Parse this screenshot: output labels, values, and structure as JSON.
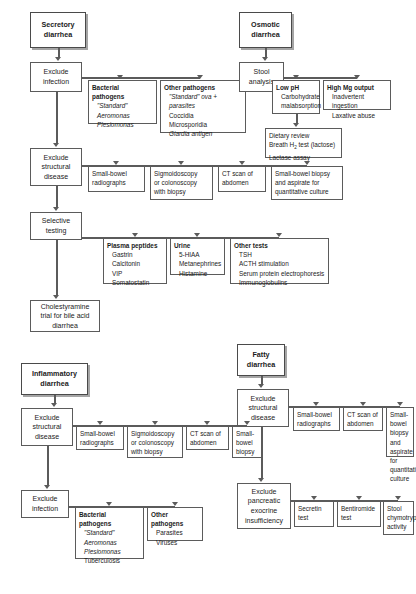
{
  "diagram": {
    "type": "clinical-algorithm-flowchart",
    "caption": "",
    "branches": [
      {
        "id": "secretory",
        "header": [
          "Secretory",
          "diarrhea"
        ],
        "steps": [
          {
            "id": "sec-exclude-infection",
            "lines": [
              "Exclude",
              "infection"
            ]
          },
          {
            "id": "sec-exclude-structural",
            "lines": [
              "Exclude",
              "structural",
              "disease"
            ]
          },
          {
            "id": "sec-selective-testing",
            "lines": [
              "Selective",
              "testing"
            ]
          },
          {
            "id": "sec-cholestyramine",
            "lines": [
              "Cholestyramine",
              "trial for bile acid",
              "diarrhea"
            ]
          }
        ],
        "panels": [
          {
            "id": "sec-bacterial-pathogens",
            "title": "Bacterial pathogens",
            "items": [
              {
                "text": "\"Standard\"",
                "style": "italic"
              },
              {
                "text": "Aeromonas",
                "style": "italic"
              },
              {
                "text": "Plesiomonas",
                "style": "italic"
              }
            ]
          },
          {
            "id": "sec-other-pathogens",
            "title": "Other pathogens",
            "items": [
              {
                "text": "\"Standard\" ova + parasites",
                "style": "italic"
              },
              {
                "text": "Coccidia",
                "style": "normal"
              },
              {
                "text": "Microsporidia",
                "style": "normal"
              },
              {
                "text": "Giardia antigen",
                "style": "italic"
              }
            ]
          },
          {
            "id": "sec-small-bowel-radiographs",
            "title": "",
            "items": [
              {
                "text": "Small-bowel",
                "style": "normal"
              },
              {
                "text": "radiographs",
                "style": "normal"
              }
            ]
          },
          {
            "id": "sec-sigmoidoscopy",
            "title": "",
            "items": [
              {
                "text": "Sigmoidoscopy",
                "style": "normal"
              },
              {
                "text": "or colonoscopy",
                "style": "normal"
              },
              {
                "text": "with biopsy",
                "style": "normal"
              }
            ]
          },
          {
            "id": "sec-ct-abdomen",
            "title": "",
            "items": [
              {
                "text": "CT scan of",
                "style": "normal"
              },
              {
                "text": "abdomen",
                "style": "normal"
              }
            ]
          },
          {
            "id": "sec-small-bowel-biopsy",
            "title": "",
            "items": [
              {
                "text": "Small-bowel biopsy",
                "style": "normal"
              },
              {
                "text": "and  aspirate for",
                "style": "normal"
              },
              {
                "text": "quantitative culture",
                "style": "normal"
              }
            ]
          },
          {
            "id": "sec-plasma-peptides",
            "title": "Plasma peptides",
            "items": [
              {
                "text": "Gastrin",
                "style": "normal"
              },
              {
                "text": "Calcitonin",
                "style": "normal"
              },
              {
                "text": "VIP",
                "style": "normal"
              },
              {
                "text": "Somatostatin",
                "style": "normal"
              }
            ]
          },
          {
            "id": "sec-urine",
            "title": "Urine",
            "items": [
              {
                "text": "5-HIAA",
                "style": "normal"
              },
              {
                "text": "Metanephrines",
                "style": "normal"
              },
              {
                "text": "Histamine",
                "style": "normal"
              }
            ]
          },
          {
            "id": "sec-other-tests",
            "title": "Other tests",
            "items": [
              {
                "text": "TSH",
                "style": "normal"
              },
              {
                "text": "ACTH stimulation",
                "style": "normal"
              },
              {
                "text": "Serum protein electrophoresis",
                "style": "normal"
              },
              {
                "text": "Immunoglobulins",
                "style": "normal"
              }
            ]
          }
        ]
      },
      {
        "id": "osmotic",
        "header": [
          "Osmotic",
          "diarrhea"
        ],
        "steps": [
          {
            "id": "osm-stool-analysis",
            "lines": [
              "Stool",
              "analysis"
            ]
          }
        ],
        "panels": [
          {
            "id": "osm-low-ph",
            "title": "Low pH",
            "items": [
              {
                "text": "Carbohydrate",
                "style": "normal"
              },
              {
                "text": "malabsorption",
                "style": "normal",
                "indent": true
              }
            ]
          },
          {
            "id": "osm-high-mg",
            "title": "High Mg output",
            "items": [
              {
                "text": "Inadvertent ingestion",
                "style": "normal"
              },
              {
                "text": "Laxative abuse",
                "style": "normal"
              }
            ]
          },
          {
            "id": "osm-dietary-review",
            "title": "",
            "items": [
              {
                "text": "Dietary review",
                "style": "normal"
              },
              {
                "text": "Breath H2 test (lactose)",
                "style": "normal",
                "subscript": "H2"
              },
              {
                "text": "Lactase assay",
                "style": "normal"
              }
            ]
          }
        ]
      },
      {
        "id": "inflammatory",
        "header": [
          "Inflammatory",
          "diarrhea"
        ],
        "steps": [
          {
            "id": "inf-exclude-structural",
            "lines": [
              "Exclude",
              "structural",
              "disease"
            ]
          },
          {
            "id": "inf-exclude-infection",
            "lines": [
              "Exclude",
              "infection"
            ]
          }
        ],
        "panels": [
          {
            "id": "inf-small-bowel-radiographs",
            "title": "",
            "items": [
              {
                "text": "Small-bowel",
                "style": "normal"
              },
              {
                "text": "radiographs",
                "style": "normal"
              }
            ]
          },
          {
            "id": "inf-sigmoidoscopy",
            "title": "",
            "items": [
              {
                "text": "Sigmoidoscopy",
                "style": "normal"
              },
              {
                "text": "or colonoscopy",
                "style": "normal"
              },
              {
                "text": "with biopsy",
                "style": "normal"
              }
            ]
          },
          {
            "id": "inf-ct-abdomen",
            "title": "",
            "items": [
              {
                "text": "CT scan of",
                "style": "normal"
              },
              {
                "text": "abdomen",
                "style": "normal"
              }
            ]
          },
          {
            "id": "inf-small-bowel-biopsy",
            "title": "",
            "items": [
              {
                "text": "Small-",
                "style": "normal"
              },
              {
                "text": "bowel",
                "style": "normal"
              },
              {
                "text": "biopsy",
                "style": "normal"
              }
            ]
          },
          {
            "id": "inf-bacterial-pathogens",
            "title": "Bacterial pathogens",
            "items": [
              {
                "text": "\"Standard\"",
                "style": "italic"
              },
              {
                "text": "Aeromonas",
                "style": "italic"
              },
              {
                "text": "Plesiomonas",
                "style": "italic"
              },
              {
                "text": "Tuberculosis",
                "style": "normal"
              }
            ]
          },
          {
            "id": "inf-other-pathogens",
            "title": "Other pathogens",
            "items": [
              {
                "text": "Parasites",
                "style": "normal"
              },
              {
                "text": "Viruses",
                "style": "normal"
              }
            ]
          }
        ]
      },
      {
        "id": "fatty",
        "header": [
          "Fatty",
          "diarrhea"
        ],
        "steps": [
          {
            "id": "fat-exclude-structural",
            "lines": [
              "Exclude",
              "structural",
              "disease"
            ]
          },
          {
            "id": "fat-exclude-pancreatic",
            "lines": [
              "Exclude",
              "pancreatic",
              "exocrine",
              "insufficiency"
            ]
          }
        ],
        "panels": [
          {
            "id": "fat-small-bowel-radiographs",
            "title": "",
            "items": [
              {
                "text": "Small-bowel",
                "style": "normal"
              },
              {
                "text": "radiographs",
                "style": "normal"
              }
            ]
          },
          {
            "id": "fat-ct-abdomen",
            "title": "",
            "items": [
              {
                "text": "CT scan of",
                "style": "normal"
              },
              {
                "text": "abdomen",
                "style": "normal"
              }
            ]
          },
          {
            "id": "fat-small-bowel-biopsy",
            "title": "",
            "items": [
              {
                "text": "Small-bowel",
                "style": "normal"
              },
              {
                "text": "biopsy and",
                "style": "normal"
              },
              {
                "text": "aspirate for",
                "style": "normal"
              },
              {
                "text": "quantitative",
                "style": "normal"
              },
              {
                "text": "culture",
                "style": "normal"
              }
            ]
          },
          {
            "id": "fat-secretin-test",
            "title": "",
            "items": [
              {
                "text": "Secretin",
                "style": "normal"
              },
              {
                "text": "test",
                "style": "normal"
              }
            ]
          },
          {
            "id": "fat-bentiromide-test",
            "title": "",
            "items": [
              {
                "text": "Bentiromide",
                "style": "normal"
              },
              {
                "text": "test",
                "style": "normal"
              }
            ]
          },
          {
            "id": "fat-stool-chymotrypsin",
            "title": "",
            "items": [
              {
                "text": "Stool",
                "style": "normal"
              },
              {
                "text": "chymotrypsin",
                "style": "normal"
              },
              {
                "text": "activity",
                "style": "normal"
              }
            ]
          }
        ]
      }
    ]
  }
}
